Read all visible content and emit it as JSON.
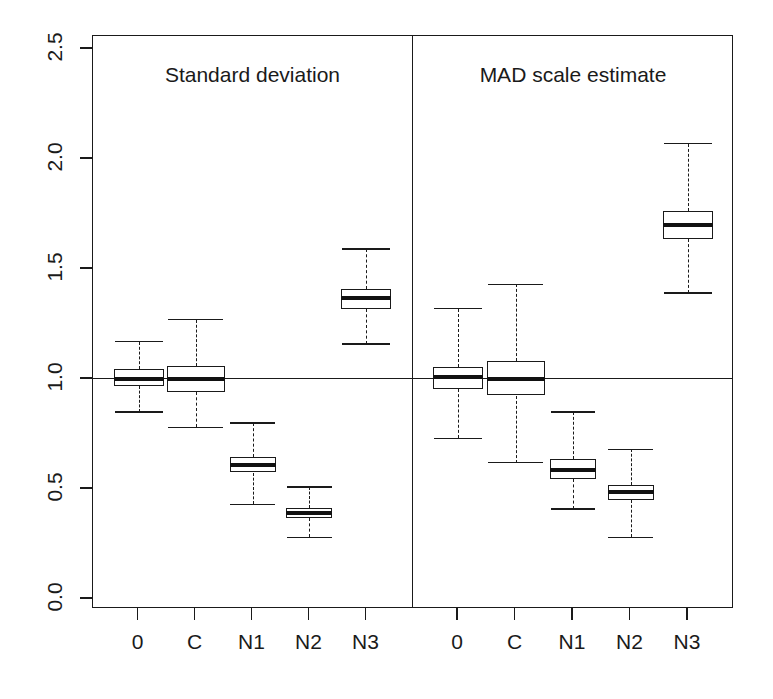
{
  "chart_data": {
    "type": "box",
    "title": "",
    "xlabel": "",
    "ylabel": "",
    "ylim": [
      0.0,
      2.5
    ],
    "yticks": [
      0.0,
      0.5,
      1.0,
      1.5,
      2.0,
      2.5
    ],
    "ytick_labels": [
      "0.0",
      "0.5",
      "1.0",
      "1.5",
      "2.0",
      "2.5"
    ],
    "grid": false,
    "legend": "none",
    "reference_line": 1.0,
    "categories": [
      "0",
      "C",
      "N1",
      "N2",
      "N3"
    ],
    "panels": [
      {
        "label": "Standard deviation",
        "boxes": [
          {
            "category": "0",
            "whisker_low": 0.85,
            "q1": 0.97,
            "median": 1.0,
            "q3": 1.045,
            "whisker_high": 1.17
          },
          {
            "category": "C",
            "whisker_low": 0.78,
            "q1": 0.94,
            "median": 1.0,
            "q3": 1.06,
            "whisker_high": 1.27
          },
          {
            "category": "N1",
            "whisker_low": 0.43,
            "q1": 0.575,
            "median": 0.61,
            "q3": 0.645,
            "whisker_high": 0.8
          },
          {
            "category": "N2",
            "whisker_low": 0.28,
            "q1": 0.37,
            "median": 0.39,
            "q3": 0.415,
            "whisker_high": 0.51
          },
          {
            "category": "N3",
            "whisker_low": 1.16,
            "q1": 1.32,
            "median": 1.37,
            "q3": 1.41,
            "whisker_high": 1.59
          }
        ]
      },
      {
        "label": "MAD scale estimate",
        "boxes": [
          {
            "category": "0",
            "whisker_low": 0.73,
            "q1": 0.955,
            "median": 1.01,
            "q3": 1.055,
            "whisker_high": 1.32
          },
          {
            "category": "C",
            "whisker_low": 0.62,
            "q1": 0.925,
            "median": 1.0,
            "q3": 1.08,
            "whisker_high": 1.43
          },
          {
            "category": "N1",
            "whisker_low": 0.41,
            "q1": 0.545,
            "median": 0.585,
            "q3": 0.635,
            "whisker_high": 0.85
          },
          {
            "category": "N2",
            "whisker_low": 0.28,
            "q1": 0.45,
            "median": 0.485,
            "q3": 0.52,
            "whisker_high": 0.68
          },
          {
            "category": "N3",
            "whisker_low": 1.39,
            "q1": 1.635,
            "median": 1.7,
            "q3": 1.765,
            "whisker_high": 2.07
          }
        ]
      }
    ]
  },
  "axis": {
    "y_tick_labels": [
      "2.5",
      "2.0",
      "1.5",
      "1.0",
      "0.5",
      "0.0"
    ],
    "x_tick_labels": [
      "0",
      "C",
      "N1",
      "N2",
      "N3",
      "0",
      "C",
      "N1",
      "N2",
      "N3"
    ]
  },
  "panel_titles": [
    "Standard deviation",
    "MAD scale estimate"
  ],
  "colors": {
    "ink": "#1a1a1a",
    "background": "#ffffff",
    "median": "#111111"
  }
}
